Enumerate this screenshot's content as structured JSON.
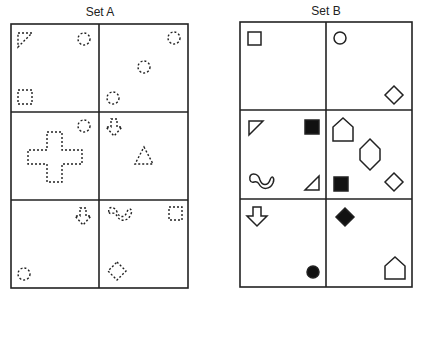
{
  "set_a": {
    "title": "Set A",
    "style": "dotted outline",
    "cells": [
      {
        "row": 1,
        "col": 1,
        "shapes": [
          "right-triangle",
          "circle",
          "square"
        ]
      },
      {
        "row": 1,
        "col": 2,
        "shapes": [
          "circle",
          "circle",
          "circle"
        ]
      },
      {
        "row": 2,
        "col": 1,
        "shapes": [
          "cross",
          "circle"
        ]
      },
      {
        "row": 2,
        "col": 2,
        "shapes": [
          "down-arrow",
          "triangle"
        ]
      },
      {
        "row": 3,
        "col": 1,
        "shapes": [
          "down-arrow",
          "circle"
        ]
      },
      {
        "row": 3,
        "col": 2,
        "shapes": [
          "wave",
          "square",
          "diamond"
        ]
      }
    ]
  },
  "set_b": {
    "title": "Set B",
    "style": "solid outline / filled",
    "cells": [
      {
        "row": 1,
        "col": 1,
        "shapes": [
          "square"
        ]
      },
      {
        "row": 1,
        "col": 2,
        "shapes": [
          "circle",
          "diamond"
        ]
      },
      {
        "row": 2,
        "col": 1,
        "shapes": [
          "right-triangle",
          "filled-square",
          "wave",
          "right-triangle"
        ]
      },
      {
        "row": 2,
        "col": 2,
        "shapes": [
          "pentagon-house",
          "hexagon",
          "filled-square",
          "diamond"
        ]
      },
      {
        "row": 3,
        "col": 1,
        "shapes": [
          "down-arrow",
          "filled-circle"
        ]
      },
      {
        "row": 3,
        "col": 2,
        "shapes": [
          "filled-diamond",
          "pentagon-house"
        ]
      }
    ]
  },
  "colors": {
    "stroke": "#222222",
    "background": "#ffffff"
  }
}
